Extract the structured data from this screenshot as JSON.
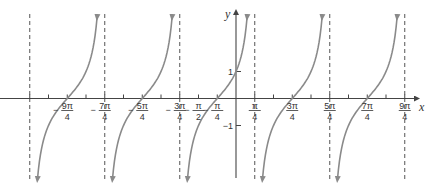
{
  "chart_data": {
    "type": "line",
    "title": "",
    "function": "y = tan(x + pi/4)",
    "xlabel": "x",
    "ylabel": "y",
    "x_unit": "pi/4",
    "x_range_units": [
      -11.2,
      9.6
    ],
    "y_range": [
      -3,
      3
    ],
    "asymptotes_units": [
      -11,
      -7,
      -3,
      1,
      5,
      9
    ],
    "zeros_units": [
      -9,
      -5,
      -1,
      3,
      7
    ],
    "x_tick_labels": [
      {
        "units": -9,
        "num": "9π",
        "den": "4",
        "neg": true
      },
      {
        "units": -7,
        "num": "7π",
        "den": "4",
        "neg": true
      },
      {
        "units": -5,
        "num": "5π",
        "den": "4",
        "neg": true
      },
      {
        "units": -3,
        "num": "3π",
        "den": "4",
        "neg": true
      },
      {
        "units": -2,
        "num": "π",
        "den": "2",
        "neg": true
      },
      {
        "units": -1,
        "num": "π",
        "den": "4",
        "neg": true
      },
      {
        "units": 1,
        "num": "π",
        "den": "4",
        "neg": false
      },
      {
        "units": 3,
        "num": "3π",
        "den": "4",
        "neg": false
      },
      {
        "units": 5,
        "num": "5π",
        "den": "4",
        "neg": false
      },
      {
        "units": 7,
        "num": "7π",
        "den": "4",
        "neg": false
      },
      {
        "units": 9,
        "num": "9π",
        "den": "4",
        "neg": false
      }
    ],
    "y_tick_labels": [
      {
        "value": 1,
        "label": "1"
      },
      {
        "value": -1,
        "label": "−1"
      }
    ],
    "grid": false,
    "colors": {
      "curve": "#8a8a8a",
      "axis": "#444444",
      "asymptote": "#555555"
    }
  }
}
